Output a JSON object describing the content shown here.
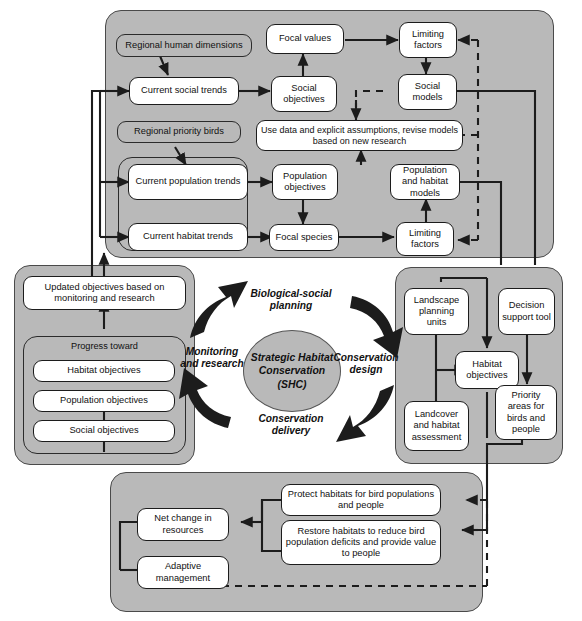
{
  "figure": {
    "colors": {
      "panel_fill": "#b9b9b9",
      "node_fill": "#ffffff",
      "stroke": "#1c1c1c",
      "background": "#ffffff"
    }
  },
  "cycle": {
    "center": "Strategic Habitat Conservation (SHC)",
    "top": "Biological-social planning",
    "right": "Conservation design",
    "bottom": "Conservation delivery",
    "left": "Monitoring and research"
  },
  "top_panel": {
    "nodes": {
      "regional_human_dimensions": "Regional human dimensions",
      "current_social_trends": "Current social trends",
      "focal_values": "Focal values",
      "limiting_factors_social": "Limiting factors",
      "social_objectives": "Social objectives",
      "social_models": "Social models",
      "regional_priority_birds": "Regional priority birds",
      "use_data": "Use data and explicit assumptions, revise models based on new research",
      "current_population_trends": "Current population trends",
      "current_habitat_trends": "Current habitat trends",
      "population_objectives": "Population objectives",
      "focal_species": "Focal species",
      "population_habitat_models": "Population and habitat models",
      "limiting_factors_bio": "Limiting factors"
    }
  },
  "left_panel": {
    "nodes": {
      "updated_objectives": "Updated objectives based on monitoring and research",
      "progress_toward": "Progress toward",
      "habitat_objectives": "Habitat objectives",
      "population_objectives": "Population objectives",
      "social_objectives": "Social objectives"
    }
  },
  "right_panel": {
    "nodes": {
      "landscape_planning_units": "Landscape planning units",
      "decision_support_tool": "Decision support tool",
      "habitat_objectives": "Habitat objectives",
      "landcover_assessment": "Landcover and habitat assessment",
      "priority_areas": "Priority areas for birds and people"
    }
  },
  "bottom_panel": {
    "nodes": {
      "protect_habitats": "Protect habitats for bird populations and people",
      "restore_habitats": "Restore habitats to reduce bird population deficits and provide value to people",
      "net_change": "Net change in resources",
      "adaptive_management": "Adaptive management"
    }
  }
}
